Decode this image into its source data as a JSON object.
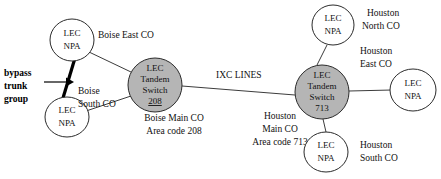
{
  "diagram": {
    "colors": {
      "tandem_fill": "#b5b5b5",
      "lec_fill": "#ffffff",
      "stroke": "#2b2b2b",
      "edge": "#3c3c3c",
      "bypass": "#000000"
    },
    "nodes": {
      "boise_east_lec": {
        "line1": "LEC",
        "line2": "NPA",
        "caption": "Boise East CO"
      },
      "boise_south_lec": {
        "line1": "LEC",
        "line2": "NPA",
        "caption_line1": "Boise",
        "caption_line2": "South CO"
      },
      "boise_tandem": {
        "line1": "LEC",
        "line2": "Tandem",
        "line3": "Switch",
        "line4": "208",
        "caption_line1": "Boise Main CO",
        "caption_line2": "Area code 208"
      },
      "houston_tandem": {
        "line1": "LEC",
        "line2": "Tandem",
        "line3": "Switch",
        "line4": "713",
        "caption_line1": "Houston",
        "caption_line2": "Main CO",
        "caption_line3": "Area code 713"
      },
      "houston_north_lec": {
        "line1": "LEC",
        "line2": "NPA",
        "caption_line1": "Houston",
        "caption_line2": "North CO"
      },
      "houston_east_lec": {
        "line1": "LEC",
        "line2": "NPA",
        "caption_line1": "Houston",
        "caption_line2": "East CO"
      },
      "houston_south_lec": {
        "line1": "LEC",
        "line2": "NPA",
        "caption_line1": "Houston",
        "caption_line2": "South CO"
      }
    },
    "annotations": {
      "bypass_line1": "bypass",
      "bypass_line2": "trunk",
      "bypass_line3": "group",
      "ixc_lines": "IXC LINES"
    }
  }
}
